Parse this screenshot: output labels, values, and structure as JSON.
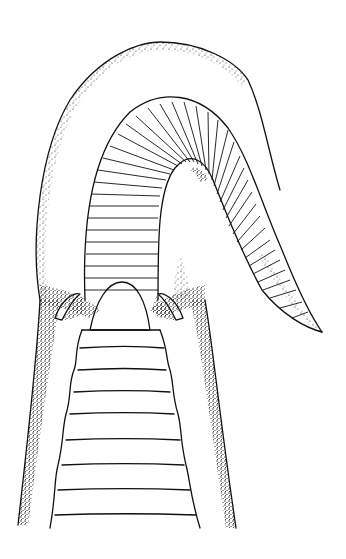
{
  "image": {
    "kind": "scientific line illustration",
    "subject": "snake head (ventral view) with extended forked tongue sheath",
    "style": "black ink stippling and line work on white",
    "colors": {
      "background": "#ffffff",
      "ink": "#111111"
    },
    "scale_count": {
      "tongue_sheath_segments": 40,
      "ventral_plates_visible": 9
    }
  }
}
